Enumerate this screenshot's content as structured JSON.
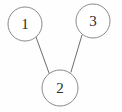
{
  "diagram": {
    "type": "node-link-graph",
    "background_color": "#fefefe",
    "node_fill_color": "#ffffff",
    "node_stroke_color": "#8d8a86",
    "edge_color": "#6f6c68",
    "label_color": "#2b2b2b",
    "nodes": [
      {
        "id": "1",
        "label": "1",
        "cx": 25,
        "cy": 24,
        "r": 17
      },
      {
        "id": "2",
        "label": "2",
        "cx": 60,
        "cy": 88,
        "r": 18
      },
      {
        "id": "3",
        "label": "3",
        "cx": 93,
        "cy": 21,
        "r": 17
      }
    ],
    "edges": [
      {
        "from": "1",
        "to": "2",
        "x1": 36,
        "y1": 37,
        "x2": 49,
        "y2": 73
      },
      {
        "from": "3",
        "to": "2",
        "x1": 82,
        "y1": 35,
        "x2": 71,
        "y2": 72
      }
    ]
  }
}
